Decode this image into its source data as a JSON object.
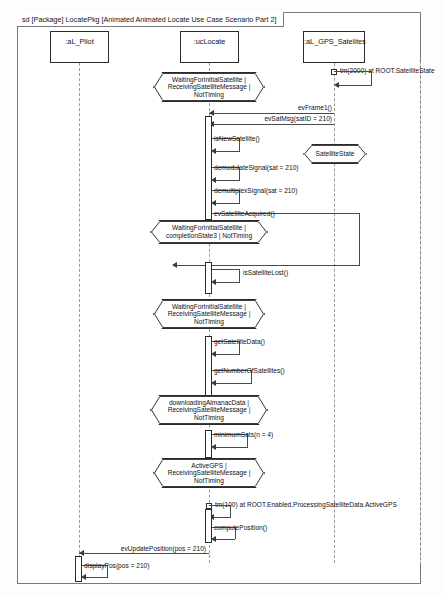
{
  "diagram": {
    "kind": "uml-sequence-diagram",
    "frame_label": "sd [Package] LocatePkg [Animated Animated Locate Use Case Scenario Part 2]"
  },
  "lifelines": [
    {
      "id": "pilot",
      "name": ":aL_Pilot"
    },
    {
      "id": "uclocate",
      "name": ":ucLocate"
    },
    {
      "id": "gps",
      "name": ":aL_GPS_Satelites"
    }
  ],
  "states": [
    {
      "id": "s1",
      "text": "WaitingForInitialSatellite |\nReceivingSatelliteMessage |\nNotTiming"
    },
    {
      "id": "s2",
      "text": "SatelliteState"
    },
    {
      "id": "s3",
      "text": "WaitingForInitialSatellite |\ncompletionState3 | NotTiming"
    },
    {
      "id": "s4",
      "text": "WaitingForInitialSatellite |\nReceivingSatelliteMessage |\nNotTiming"
    },
    {
      "id": "s5",
      "text": "downloadingAlmanacData |\nReceivingSatelliteMessage |\nNotTiming"
    },
    {
      "id": "s6",
      "text": "ActiveGPS |\nReceivingSatelliteMessage |\nNotTiming"
    }
  ],
  "timers": [
    {
      "id": "t1",
      "text": "tm(2000) at ROOT.SatelliteState"
    },
    {
      "id": "t2",
      "text": "tm(100) at ROOT.Enabled.ProcessingSatelliteData.ActiveGPS"
    }
  ],
  "messages": [
    {
      "id": "m1",
      "text": "evFrame1()",
      "from": "gps",
      "to": "uclocate",
      "kind": "async-left"
    },
    {
      "id": "m2",
      "text": "evSatMsg(satID = 210)",
      "from": "gps",
      "to": "uclocate",
      "kind": "async-left"
    },
    {
      "id": "m3",
      "text": "isNewSatellite()",
      "from": "uclocate",
      "to": "uclocate",
      "kind": "self"
    },
    {
      "id": "m4",
      "text": "demodulateSignal(sat = 210)",
      "from": "uclocate",
      "to": "uclocate",
      "kind": "self"
    },
    {
      "id": "m5",
      "text": "demultiplexSignal(sat = 210)",
      "from": "uclocate",
      "to": "uclocate",
      "kind": "self"
    },
    {
      "id": "m6",
      "text": "evSatelliteAcquired()",
      "from": "uclocate",
      "to": "uclocate",
      "kind": "self"
    },
    {
      "id": "m7",
      "text": "isSatelliteLost()",
      "from": "uclocate",
      "to": "uclocate",
      "kind": "self"
    },
    {
      "id": "m8",
      "text": "getSatelliteData()",
      "from": "uclocate",
      "to": "uclocate",
      "kind": "self"
    },
    {
      "id": "m9",
      "text": "getNumberOfSatellites()",
      "from": "uclocate",
      "to": "uclocate",
      "kind": "self"
    },
    {
      "id": "m10",
      "text": "minimumSats(n = 4)",
      "from": "uclocate",
      "to": "uclocate",
      "kind": "self"
    },
    {
      "id": "m11",
      "text": "computePosition()",
      "from": "uclocate",
      "to": "uclocate",
      "kind": "self"
    },
    {
      "id": "m12",
      "text": "evUpdatePosition(pos = 210)",
      "from": "uclocate",
      "to": "pilot",
      "kind": "async-left"
    },
    {
      "id": "m13",
      "text": "displayPos(pos = 210)",
      "from": "pilot",
      "to": "pilot",
      "kind": "self"
    }
  ]
}
